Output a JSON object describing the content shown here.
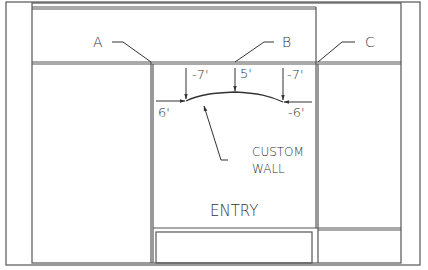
{
  "drawing": {
    "callouts": [
      {
        "id": "A",
        "label": "A"
      },
      {
        "id": "B",
        "label": "B"
      },
      {
        "id": "C",
        "label": "C"
      }
    ],
    "dimensions": {
      "left_offset": "6'",
      "left_drop": "-7'",
      "center_drop": "5'",
      "right_drop": "-7'",
      "right_offset": "-6'"
    },
    "annotation": {
      "line1": "CUSTOM",
      "line2": "WALL"
    },
    "room_label": "ENTRY",
    "colors": {
      "line": "#555555",
      "text": "#333333",
      "background": "#ffffff"
    }
  }
}
